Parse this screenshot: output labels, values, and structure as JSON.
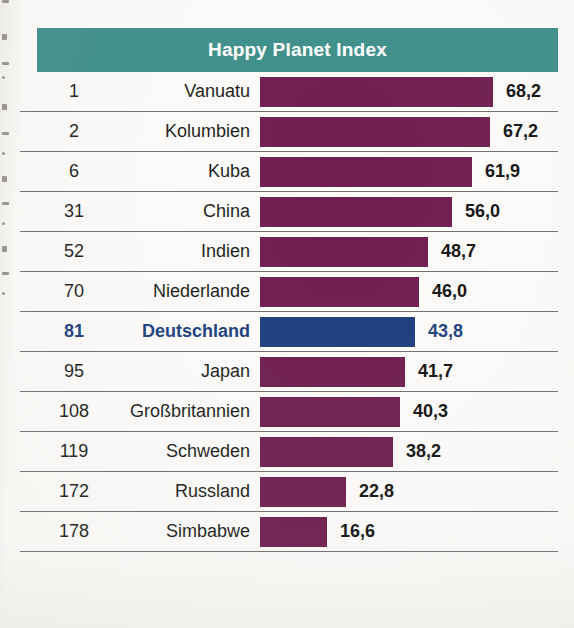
{
  "header": {
    "title": "Happy Planet Index",
    "background_color": "#3d8f8a",
    "text_color": "#ffffff"
  },
  "colors": {
    "bar_default": "#6f1e4f",
    "bar_highlight": "#1c3f7e",
    "highlight_text": "#1c3f7e",
    "rule": "#58565a",
    "page_background": "#fdfcfa"
  },
  "chart_data": {
    "type": "bar",
    "title": "Happy Planet Index",
    "xlabel": "",
    "ylabel": "",
    "orientation": "horizontal",
    "grid": false,
    "legend": null,
    "xlim": [
      0,
      70
    ],
    "value_decimal_separator": ",",
    "columns": [
      "Rang",
      "Land",
      "Happy Planet Index"
    ],
    "categories": [
      "Vanuatu",
      "Kolumbien",
      "Kuba",
      "China",
      "Indien",
      "Niederlande",
      "Deutschland",
      "Japan",
      "Großbritannien",
      "Schweden",
      "Russland",
      "Simbabwe"
    ],
    "ranks": [
      1,
      2,
      6,
      31,
      52,
      70,
      81,
      95,
      108,
      119,
      172,
      178
    ],
    "values": [
      68.2,
      67.2,
      61.9,
      56.0,
      48.7,
      46.0,
      43.8,
      41.7,
      40.3,
      38.2,
      22.8,
      16.6
    ],
    "highlighted_category": "Deutschland"
  },
  "rows": [
    {
      "rank": "1",
      "country": "Vanuatu",
      "value": "68,2",
      "bar_width": 233,
      "highlight": false
    },
    {
      "rank": "2",
      "country": "Kolumbien",
      "value": "67,2",
      "bar_width": 230,
      "highlight": false
    },
    {
      "rank": "6",
      "country": "Kuba",
      "value": "61,9",
      "bar_width": 212,
      "highlight": false
    },
    {
      "rank": "31",
      "country": "China",
      "value": "56,0",
      "bar_width": 192,
      "highlight": false
    },
    {
      "rank": "52",
      "country": "Indien",
      "value": "48,7",
      "bar_width": 168,
      "highlight": false
    },
    {
      "rank": "70",
      "country": "Niederlande",
      "value": "46,0",
      "bar_width": 159,
      "highlight": false
    },
    {
      "rank": "81",
      "country": "Deutschland",
      "value": "43,8",
      "bar_width": 155,
      "highlight": true
    },
    {
      "rank": "95",
      "country": "Japan",
      "value": "41,7",
      "bar_width": 145,
      "highlight": false
    },
    {
      "rank": "108",
      "country": "Großbritannien",
      "value": "40,3",
      "bar_width": 140,
      "highlight": false
    },
    {
      "rank": "119",
      "country": "Schweden",
      "value": "38,2",
      "bar_width": 133,
      "highlight": false
    },
    {
      "rank": "172",
      "country": "Russland",
      "value": "22,8",
      "bar_width": 86,
      "highlight": false
    },
    {
      "rank": "178",
      "country": "Simbabwe",
      "value": "16,6",
      "bar_width": 67,
      "highlight": false
    }
  ]
}
